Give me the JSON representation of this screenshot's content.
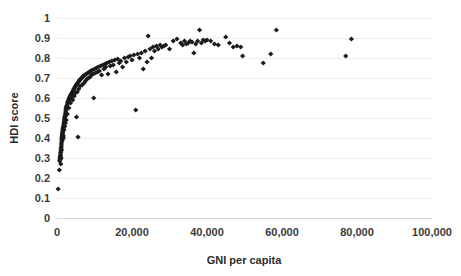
{
  "chart_data": {
    "type": "scatter",
    "title": "",
    "xlabel": "GNI per capita",
    "ylabel": "HDI score",
    "xlim": [
      0,
      100000
    ],
    "ylim": [
      0,
      1
    ],
    "grid": "horizontal",
    "legend": "none",
    "marker": "diamond",
    "marker_color": "#1a1a1a",
    "xticks": [
      0,
      20000,
      40000,
      60000,
      80000,
      100000
    ],
    "xticklabels": [
      "0",
      "20,000",
      "40,000",
      "60,000",
      "80,000",
      "100,000"
    ],
    "yticks": [
      0,
      0.1,
      0.2,
      0.3,
      0.4,
      0.5,
      0.6,
      0.7,
      0.8,
      0.9,
      1
    ],
    "yticklabels": [
      "0",
      "0.1",
      "0.2",
      "0.3",
      "0.4",
      "0.5",
      "0.6",
      "0.7",
      "0.8",
      "0.9",
      "1"
    ],
    "series": [
      {
        "name": "Countries",
        "points": [
          [
            300,
            0.145
          ],
          [
            620,
            0.24
          ],
          [
            700,
            0.285
          ],
          [
            760,
            0.29
          ],
          [
            800,
            0.3
          ],
          [
            850,
            0.305
          ],
          [
            880,
            0.31
          ],
          [
            900,
            0.295
          ],
          [
            930,
            0.315
          ],
          [
            960,
            0.325
          ],
          [
            1000,
            0.33
          ],
          [
            1020,
            0.27
          ],
          [
            1050,
            0.34
          ],
          [
            1080,
            0.35
          ],
          [
            1100,
            0.3
          ],
          [
            1150,
            0.355
          ],
          [
            1180,
            0.365
          ],
          [
            1200,
            0.375
          ],
          [
            1240,
            0.34
          ],
          [
            1260,
            0.385
          ],
          [
            1300,
            0.395
          ],
          [
            1320,
            0.4
          ],
          [
            1350,
            0.405
          ],
          [
            1380,
            0.41
          ],
          [
            1400,
            0.415
          ],
          [
            1420,
            0.39
          ],
          [
            1450,
            0.42
          ],
          [
            1480,
            0.425
          ],
          [
            1500,
            0.43
          ],
          [
            1520,
            0.4
          ],
          [
            1550,
            0.435
          ],
          [
            1580,
            0.44
          ],
          [
            1600,
            0.445
          ],
          [
            1650,
            0.45
          ],
          [
            1680,
            0.4
          ],
          [
            1700,
            0.455
          ],
          [
            1720,
            0.41
          ],
          [
            1750,
            0.46
          ],
          [
            1800,
            0.47
          ],
          [
            1850,
            0.44
          ],
          [
            1880,
            0.48
          ],
          [
            1900,
            0.455
          ],
          [
            1950,
            0.49
          ],
          [
            2000,
            0.5
          ],
          [
            2050,
            0.46
          ],
          [
            2100,
            0.505
          ],
          [
            2150,
            0.51
          ],
          [
            2200,
            0.52
          ],
          [
            2250,
            0.475
          ],
          [
            2300,
            0.53
          ],
          [
            2350,
            0.54
          ],
          [
            2400,
            0.55
          ],
          [
            2450,
            0.49
          ],
          [
            2500,
            0.555
          ],
          [
            2600,
            0.56
          ],
          [
            2700,
            0.565
          ],
          [
            2750,
            0.52
          ],
          [
            2800,
            0.575
          ],
          [
            2900,
            0.58
          ],
          [
            3000,
            0.585
          ],
          [
            3100,
            0.59
          ],
          [
            3150,
            0.55
          ],
          [
            3200,
            0.595
          ],
          [
            3300,
            0.6
          ],
          [
            3400,
            0.605
          ],
          [
            3500,
            0.61
          ],
          [
            3600,
            0.575
          ],
          [
            3700,
            0.615
          ],
          [
            3800,
            0.62
          ],
          [
            3900,
            0.6
          ],
          [
            4000,
            0.625
          ],
          [
            4100,
            0.63
          ],
          [
            4200,
            0.59
          ],
          [
            4300,
            0.635
          ],
          [
            4400,
            0.64
          ],
          [
            4500,
            0.645
          ],
          [
            4600,
            0.61
          ],
          [
            4700,
            0.65
          ],
          [
            4800,
            0.655
          ],
          [
            4900,
            0.625
          ],
          [
            5000,
            0.66
          ],
          [
            5100,
            0.665
          ],
          [
            5200,
            0.505
          ],
          [
            5300,
            0.67
          ],
          [
            5400,
            0.63
          ],
          [
            5500,
            0.675
          ],
          [
            5600,
            0.405
          ],
          [
            5700,
            0.68
          ],
          [
            5800,
            0.645
          ],
          [
            5900,
            0.685
          ],
          [
            6000,
            0.69
          ],
          [
            6200,
            0.66
          ],
          [
            6400,
            0.695
          ],
          [
            6500,
            0.7
          ],
          [
            6700,
            0.665
          ],
          [
            6900,
            0.705
          ],
          [
            7000,
            0.71
          ],
          [
            7200,
            0.675
          ],
          [
            7400,
            0.715
          ],
          [
            7600,
            0.685
          ],
          [
            7800,
            0.72
          ],
          [
            8000,
            0.695
          ],
          [
            8200,
            0.725
          ],
          [
            8400,
            0.7
          ],
          [
            8600,
            0.73
          ],
          [
            8800,
            0.705
          ],
          [
            9000,
            0.735
          ],
          [
            9200,
            0.715
          ],
          [
            9400,
            0.74
          ],
          [
            9600,
            0.72
          ],
          [
            9800,
            0.6
          ],
          [
            10000,
            0.745
          ],
          [
            10200,
            0.725
          ],
          [
            10500,
            0.75
          ],
          [
            10800,
            0.73
          ],
          [
            11000,
            0.755
          ],
          [
            11300,
            0.735
          ],
          [
            11600,
            0.76
          ],
          [
            11900,
            0.715
          ],
          [
            12200,
            0.765
          ],
          [
            12500,
            0.745
          ],
          [
            12800,
            0.77
          ],
          [
            13000,
            0.755
          ],
          [
            13300,
            0.775
          ],
          [
            13600,
            0.72
          ],
          [
            13900,
            0.78
          ],
          [
            14200,
            0.76
          ],
          [
            14600,
            0.785
          ],
          [
            15000,
            0.765
          ],
          [
            15400,
            0.79
          ],
          [
            15800,
            0.73
          ],
          [
            16200,
            0.795
          ],
          [
            16600,
            0.775
          ],
          [
            17000,
            0.785
          ],
          [
            17500,
            0.755
          ],
          [
            18000,
            0.8
          ],
          [
            18500,
            0.78
          ],
          [
            19000,
            0.805
          ],
          [
            19500,
            0.81
          ],
          [
            20000,
            0.79
          ],
          [
            20500,
            0.815
          ],
          [
            21000,
            0.54
          ],
          [
            21500,
            0.82
          ],
          [
            22000,
            0.8
          ],
          [
            22500,
            0.825
          ],
          [
            23000,
            0.745
          ],
          [
            23500,
            0.835
          ],
          [
            24000,
            0.78
          ],
          [
            24300,
            0.91
          ],
          [
            24800,
            0.845
          ],
          [
            25200,
            0.8
          ],
          [
            25600,
            0.855
          ],
          [
            26000,
            0.835
          ],
          [
            26500,
            0.86
          ],
          [
            27000,
            0.845
          ],
          [
            27500,
            0.865
          ],
          [
            28000,
            0.855
          ],
          [
            28500,
            0.86
          ],
          [
            29000,
            0.865
          ],
          [
            30000,
            0.845
          ],
          [
            31000,
            0.885
          ],
          [
            32000,
            0.895
          ],
          [
            33000,
            0.875
          ],
          [
            33500,
            0.865
          ],
          [
            34000,
            0.885
          ],
          [
            34500,
            0.87
          ],
          [
            35000,
            0.875
          ],
          [
            35500,
            0.885
          ],
          [
            36000,
            0.88
          ],
          [
            36500,
            0.825
          ],
          [
            37000,
            0.87
          ],
          [
            37500,
            0.885
          ],
          [
            38000,
            0.94
          ],
          [
            38500,
            0.875
          ],
          [
            39000,
            0.89
          ],
          [
            39500,
            0.885
          ],
          [
            40000,
            0.89
          ],
          [
            41000,
            0.885
          ],
          [
            42000,
            0.87
          ],
          [
            43000,
            0.865
          ],
          [
            45000,
            0.905
          ],
          [
            46000,
            0.875
          ],
          [
            47000,
            0.855
          ],
          [
            48000,
            0.86
          ],
          [
            49000,
            0.855
          ],
          [
            49500,
            0.81
          ],
          [
            55000,
            0.775
          ],
          [
            57000,
            0.82
          ],
          [
            58500,
            0.94
          ],
          [
            77000,
            0.81
          ],
          [
            78500,
            0.895
          ]
        ]
      }
    ]
  },
  "axes": {
    "y_title": "HDI score",
    "x_title": "GNI per capita"
  }
}
